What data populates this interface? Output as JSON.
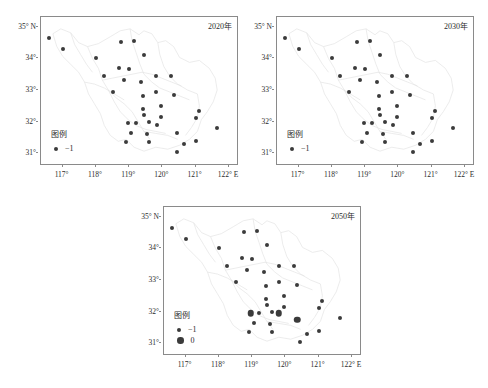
{
  "figure": {
    "dot_color": "#3b3b3b",
    "frame_color": "#8a8a8a",
    "map_outline_color": "#e2e2e2"
  },
  "axes": {
    "xticks": [
      "117°",
      "118°",
      "119°",
      "120°",
      "121°",
      "122° E"
    ],
    "xtick_values": [
      117,
      118,
      119,
      120,
      121,
      122
    ],
    "yticks": [
      "35° N",
      "34°",
      "33°",
      "32°",
      "31°"
    ],
    "ytick_values": [
      35,
      34,
      33,
      32,
      31
    ],
    "xlim": [
      116.35,
      122.3
    ],
    "ylim": [
      30.6,
      35.3
    ]
  },
  "legend": {
    "title": "图例",
    "entries_single": [
      {
        "label": "−1",
        "size": "small"
      }
    ],
    "entries_double": [
      {
        "label": "−1",
        "size": "small"
      },
      {
        "label": "0",
        "size": "large"
      }
    ]
  },
  "chart_data": {
    "type": "scatter",
    "title": "",
    "xlabel": "",
    "ylabel": "",
    "xlim": [
      116.35,
      122.3
    ],
    "ylim": [
      30.6,
      35.3
    ],
    "grid": false,
    "legend_position": "bottom-left",
    "panels": [
      {
        "title": "2020年",
        "legend_entries": [
          {
            "label": "−1",
            "size": "small"
          }
        ],
        "points": [
          {
            "lon": 116.6,
            "lat": 34.65,
            "value": -1
          },
          {
            "lon": 117.0,
            "lat": 34.3,
            "value": -1
          },
          {
            "lon": 118.0,
            "lat": 34.0,
            "value": -1
          },
          {
            "lon": 118.75,
            "lat": 34.5,
            "value": -1
          },
          {
            "lon": 119.15,
            "lat": 34.55,
            "value": -1
          },
          {
            "lon": 118.25,
            "lat": 33.45,
            "value": -1
          },
          {
            "lon": 118.7,
            "lat": 33.7,
            "value": -1
          },
          {
            "lon": 119.0,
            "lat": 33.65,
            "value": -1
          },
          {
            "lon": 119.45,
            "lat": 34.1,
            "value": -1
          },
          {
            "lon": 118.85,
            "lat": 33.3,
            "value": -1
          },
          {
            "lon": 119.35,
            "lat": 33.25,
            "value": -1
          },
          {
            "lon": 118.5,
            "lat": 32.95,
            "value": -1
          },
          {
            "lon": 119.8,
            "lat": 33.45,
            "value": -1
          },
          {
            "lon": 120.25,
            "lat": 33.45,
            "value": -1
          },
          {
            "lon": 119.8,
            "lat": 32.95,
            "value": -1
          },
          {
            "lon": 119.4,
            "lat": 32.8,
            "value": -1
          },
          {
            "lon": 120.35,
            "lat": 32.85,
            "value": -1
          },
          {
            "lon": 119.4,
            "lat": 32.4,
            "value": -1
          },
          {
            "lon": 119.95,
            "lat": 32.5,
            "value": -1
          },
          {
            "lon": 119.45,
            "lat": 32.2,
            "value": -1
          },
          {
            "lon": 119.95,
            "lat": 32.15,
            "value": -1
          },
          {
            "lon": 118.95,
            "lat": 31.95,
            "value": -1
          },
          {
            "lon": 119.2,
            "lat": 31.95,
            "value": -1
          },
          {
            "lon": 119.6,
            "lat": 32.0,
            "value": -1
          },
          {
            "lon": 119.85,
            "lat": 31.9,
            "value": -1
          },
          {
            "lon": 121.1,
            "lat": 32.35,
            "value": -1
          },
          {
            "lon": 121.0,
            "lat": 32.1,
            "value": -1
          },
          {
            "lon": 121.65,
            "lat": 31.8,
            "value": -1
          },
          {
            "lon": 120.45,
            "lat": 31.65,
            "value": -1
          },
          {
            "lon": 119.05,
            "lat": 31.65,
            "value": -1
          },
          {
            "lon": 119.55,
            "lat": 31.6,
            "value": -1
          },
          {
            "lon": 118.9,
            "lat": 31.35,
            "value": -1
          },
          {
            "lon": 119.6,
            "lat": 31.35,
            "value": -1
          },
          {
            "lon": 120.65,
            "lat": 31.3,
            "value": -1
          },
          {
            "lon": 121.0,
            "lat": 31.4,
            "value": -1
          },
          {
            "lon": 120.45,
            "lat": 31.05,
            "value": -1
          }
        ]
      },
      {
        "title": "2030年",
        "legend_entries": [
          {
            "label": "−1",
            "size": "small"
          }
        ],
        "points": [
          {
            "lon": 116.6,
            "lat": 34.65,
            "value": -1
          },
          {
            "lon": 117.0,
            "lat": 34.3,
            "value": -1
          },
          {
            "lon": 118.0,
            "lat": 34.0,
            "value": -1
          },
          {
            "lon": 118.75,
            "lat": 34.5,
            "value": -1
          },
          {
            "lon": 119.15,
            "lat": 34.55,
            "value": -1
          },
          {
            "lon": 118.25,
            "lat": 33.45,
            "value": -1
          },
          {
            "lon": 118.7,
            "lat": 33.7,
            "value": -1
          },
          {
            "lon": 119.0,
            "lat": 33.65,
            "value": -1
          },
          {
            "lon": 119.45,
            "lat": 34.1,
            "value": -1
          },
          {
            "lon": 118.85,
            "lat": 33.3,
            "value": -1
          },
          {
            "lon": 119.35,
            "lat": 33.25,
            "value": -1
          },
          {
            "lon": 118.5,
            "lat": 32.95,
            "value": -1
          },
          {
            "lon": 119.8,
            "lat": 33.45,
            "value": -1
          },
          {
            "lon": 120.25,
            "lat": 33.45,
            "value": -1
          },
          {
            "lon": 119.8,
            "lat": 32.95,
            "value": -1
          },
          {
            "lon": 119.4,
            "lat": 32.8,
            "value": -1
          },
          {
            "lon": 120.35,
            "lat": 32.85,
            "value": -1
          },
          {
            "lon": 119.4,
            "lat": 32.4,
            "value": -1
          },
          {
            "lon": 119.95,
            "lat": 32.5,
            "value": -1
          },
          {
            "lon": 119.45,
            "lat": 32.2,
            "value": -1
          },
          {
            "lon": 119.95,
            "lat": 32.15,
            "value": -1
          },
          {
            "lon": 118.95,
            "lat": 31.95,
            "value": -1
          },
          {
            "lon": 119.2,
            "lat": 31.95,
            "value": -1
          },
          {
            "lon": 119.6,
            "lat": 32.0,
            "value": -1
          },
          {
            "lon": 119.85,
            "lat": 31.9,
            "value": -1
          },
          {
            "lon": 121.1,
            "lat": 32.35,
            "value": -1
          },
          {
            "lon": 121.0,
            "lat": 32.1,
            "value": -1
          },
          {
            "lon": 121.65,
            "lat": 31.8,
            "value": -1
          },
          {
            "lon": 120.45,
            "lat": 31.65,
            "value": -1
          },
          {
            "lon": 119.05,
            "lat": 31.65,
            "value": -1
          },
          {
            "lon": 119.55,
            "lat": 31.6,
            "value": -1
          },
          {
            "lon": 118.9,
            "lat": 31.35,
            "value": -1
          },
          {
            "lon": 119.6,
            "lat": 31.35,
            "value": -1
          },
          {
            "lon": 120.65,
            "lat": 31.3,
            "value": -1
          },
          {
            "lon": 121.0,
            "lat": 31.4,
            "value": -1
          },
          {
            "lon": 120.45,
            "lat": 31.05,
            "value": -1
          }
        ]
      },
      {
        "title": "2050年",
        "legend_entries": [
          {
            "label": "−1",
            "size": "small"
          },
          {
            "label": "0",
            "size": "large"
          }
        ],
        "points": [
          {
            "lon": 116.6,
            "lat": 34.65,
            "value": -1
          },
          {
            "lon": 117.0,
            "lat": 34.3,
            "value": -1
          },
          {
            "lon": 118.0,
            "lat": 34.0,
            "value": -1
          },
          {
            "lon": 118.75,
            "lat": 34.5,
            "value": -1
          },
          {
            "lon": 119.15,
            "lat": 34.55,
            "value": -1
          },
          {
            "lon": 118.25,
            "lat": 33.45,
            "value": -1
          },
          {
            "lon": 118.7,
            "lat": 33.7,
            "value": -1
          },
          {
            "lon": 119.0,
            "lat": 33.65,
            "value": -1
          },
          {
            "lon": 119.45,
            "lat": 34.1,
            "value": -1
          },
          {
            "lon": 118.85,
            "lat": 33.3,
            "value": -1
          },
          {
            "lon": 119.35,
            "lat": 33.25,
            "value": -1
          },
          {
            "lon": 118.5,
            "lat": 32.95,
            "value": -1
          },
          {
            "lon": 119.8,
            "lat": 33.45,
            "value": -1
          },
          {
            "lon": 120.25,
            "lat": 33.45,
            "value": -1
          },
          {
            "lon": 119.8,
            "lat": 32.95,
            "value": -1
          },
          {
            "lon": 119.4,
            "lat": 32.8,
            "value": -1
          },
          {
            "lon": 120.35,
            "lat": 32.85,
            "value": -1
          },
          {
            "lon": 119.4,
            "lat": 32.4,
            "value": -1
          },
          {
            "lon": 119.95,
            "lat": 32.5,
            "value": -1
          },
          {
            "lon": 119.45,
            "lat": 32.2,
            "value": -1
          },
          {
            "lon": 119.95,
            "lat": 32.15,
            "value": -1
          },
          {
            "lon": 118.95,
            "lat": 31.95,
            "value": 0
          },
          {
            "lon": 119.2,
            "lat": 31.95,
            "value": -1
          },
          {
            "lon": 119.6,
            "lat": 32.0,
            "value": -1
          },
          {
            "lon": 119.8,
            "lat": 31.95,
            "value": 0
          },
          {
            "lon": 121.1,
            "lat": 32.35,
            "value": -1
          },
          {
            "lon": 121.0,
            "lat": 32.1,
            "value": -1
          },
          {
            "lon": 121.65,
            "lat": 31.8,
            "value": -1
          },
          {
            "lon": 120.35,
            "lat": 31.75,
            "value": 0
          },
          {
            "lon": 119.05,
            "lat": 31.65,
            "value": -1
          },
          {
            "lon": 119.55,
            "lat": 31.6,
            "value": -1
          },
          {
            "lon": 118.9,
            "lat": 31.35,
            "value": -1
          },
          {
            "lon": 119.6,
            "lat": 31.35,
            "value": -1
          },
          {
            "lon": 120.65,
            "lat": 31.3,
            "value": -1
          },
          {
            "lon": 121.0,
            "lat": 31.4,
            "value": -1
          },
          {
            "lon": 120.45,
            "lat": 31.05,
            "value": -1
          }
        ]
      }
    ]
  }
}
